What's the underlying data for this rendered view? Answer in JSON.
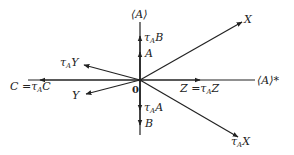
{
  "diagram": {
    "origin_label": "0",
    "vertical_axis_label": "⟨A⟩",
    "horizontal_axis_label": "⟨A⟩*",
    "vectors": {
      "X": "X",
      "tauA_X": "τ",
      "tauA_X_sub": "A",
      "tauA_X_main": "X",
      "Y": "Y",
      "tauA_Y": "τ",
      "tauA_Y_sub": "A",
      "tauA_Y_main": "Y",
      "C_eq": "C =τ",
      "C_sub": "A",
      "C_main": "C",
      "Z_eq": "Z =τ",
      "Z_sub": "A",
      "Z_main": "Z",
      "A": "A",
      "tauA_B": "τ",
      "tauA_B_sub": "A",
      "tauA_B_main": "B",
      "tauA_A": "τ",
      "tauA_A_sub": "A",
      "tauA_A_main": "A",
      "B": "B"
    },
    "line_color": "#222222"
  }
}
